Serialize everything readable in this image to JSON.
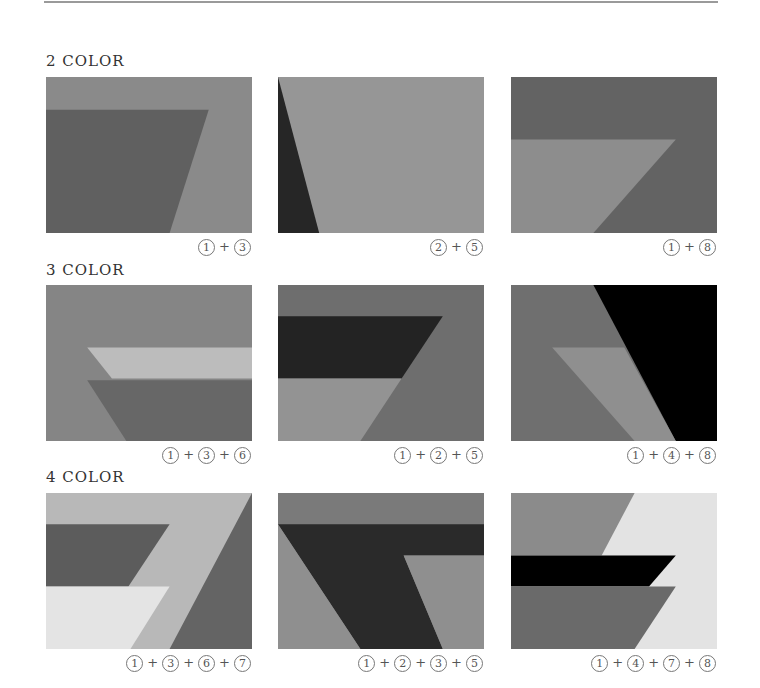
{
  "palette": {
    "1": "#6f6f6f",
    "2": "#2a2a2a",
    "3": "#8a8a8a",
    "4": "#000000",
    "5": "#939393",
    "6": "#bdbdbd",
    "7": "#e6e6e6",
    "8": "#8c8c8c"
  },
  "rows": [
    {
      "label": "2 COLOR",
      "panels": [
        {
          "caption": [
            "1",
            "3"
          ],
          "background": "#8a8a8a",
          "shapes": [
            {
              "fill": "#606060",
              "points": "0,21 79,21 60,100 0,100"
            }
          ]
        },
        {
          "caption": [
            "2",
            "5"
          ],
          "background": "#969696",
          "shapes": [
            {
              "fill": "#262626",
              "points": "0,0 20,100 0,100"
            }
          ]
        },
        {
          "caption": [
            "1",
            "8"
          ],
          "background": "#636363",
          "shapes": [
            {
              "fill": "#8d8d8d",
              "points": "0,40 80,40 40,100 0,100"
            }
          ]
        }
      ]
    },
    {
      "label": "3 COLOR",
      "panels": [
        {
          "caption": [
            "1",
            "3",
            "6"
          ],
          "background": "#858585",
          "shapes": [
            {
              "fill": "#bcbcbc",
              "points": "20,40 100,40 100,60 32,60"
            },
            {
              "fill": "#676767",
              "points": "20,61 100,61 100,100 39,100"
            }
          ]
        },
        {
          "caption": [
            "1",
            "2",
            "5"
          ],
          "background": "#6e6e6e",
          "shapes": [
            {
              "fill": "#232323",
              "points": "0,20 80,20 60,60 0,60"
            },
            {
              "fill": "#939393",
              "points": "0,60 60,60 40,100 0,100"
            }
          ]
        },
        {
          "caption": [
            "1",
            "4",
            "8"
          ],
          "background": "#6f6f6f",
          "shapes": [
            {
              "fill": "#000000",
              "points": "40,0 100,0 100,100 80,100"
            },
            {
              "fill": "#8f8f8f",
              "points": "20,40 55,40 80,100 60,100"
            }
          ]
        }
      ]
    },
    {
      "label": "4 COLOR",
      "panels": [
        {
          "caption": [
            "1",
            "3",
            "6",
            "7"
          ],
          "background": "#b8b8b8",
          "shapes": [
            {
              "fill": "#646464",
              "points": "100,0 100,100 60,100"
            },
            {
              "fill": "#5c5c5c",
              "points": "0,20 60,20 40,60 0,60"
            },
            {
              "fill": "#e4e4e4",
              "points": "0,60 60,60 41,100 0,100"
            }
          ]
        },
        {
          "caption": [
            "1",
            "2",
            "3",
            "5"
          ],
          "background": "#7a7a7a",
          "shapes": [
            {
              "fill": "#2a2a2a",
              "points": "0,20 100,20 100,40 61,40 80,100 40,100 0,20"
            },
            {
              "fill": "#8f8f8f",
              "points": "0,20 40,100 0,100"
            },
            {
              "fill": "#8f8f8f",
              "points": "61,40 100,40 100,100 80,100"
            }
          ]
        },
        {
          "caption": [
            "1",
            "4",
            "7",
            "8"
          ],
          "background": "#e3e3e3",
          "shapes": [
            {
              "fill": "#8b8b8b",
              "points": "0,0 60,0 44,40 0,40"
            },
            {
              "fill": "#000000",
              "points": "0,40 80,40 67,60 0,60"
            },
            {
              "fill": "#6a6a6a",
              "points": "0,60 80,60 60,100 0,100"
            }
          ]
        }
      ]
    }
  ],
  "layout": {
    "row_label_tops": [
      52,
      261,
      468
    ],
    "panel_tops": [
      77,
      285,
      493
    ],
    "panel_lefts": [
      46,
      278,
      511
    ],
    "caption_tops": [
      239,
      447,
      655
    ]
  }
}
